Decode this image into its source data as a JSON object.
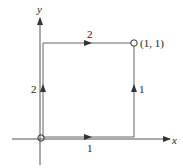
{
  "diagram": {
    "axes": {
      "x_label": "x",
      "y_label": "y"
    },
    "endpoint_label": "(1, 1)",
    "path_segments": [
      {
        "name": "bottom",
        "from": [
          0,
          0
        ],
        "to": [
          1,
          0
        ],
        "label": "1",
        "direction": "right"
      },
      {
        "name": "right",
        "from": [
          1,
          0
        ],
        "to": [
          1,
          1
        ],
        "label": "1",
        "direction": "up"
      },
      {
        "name": "left",
        "from": [
          0,
          0
        ],
        "to": [
          0,
          1
        ],
        "label": "2",
        "direction": "up"
      },
      {
        "name": "top",
        "from": [
          0,
          1
        ],
        "to": [
          1,
          1
        ],
        "label": "2",
        "direction": "right"
      }
    ],
    "colors": {
      "line": "#555555",
      "text": "#222222"
    }
  }
}
